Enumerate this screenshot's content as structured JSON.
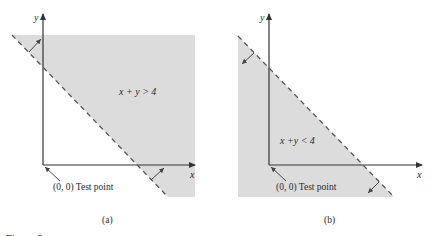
{
  "figure": {
    "caption_partial": "Figure 3.",
    "panels": [
      {
        "id": "a",
        "caption": "(a)",
        "inequality": "x + y > 4",
        "boundary": "x + y = 4",
        "boundary_style": "dashed",
        "shaded_side": "above",
        "axis_x_label": "x",
        "axis_y_label": "y",
        "test_point_label": "(0, 0) Test point"
      },
      {
        "id": "b",
        "caption": "(b)",
        "inequality": "x +y < 4",
        "boundary": "x + y = 4",
        "boundary_style": "dashed",
        "shaded_side": "below",
        "axis_x_label": "x",
        "axis_y_label": "y",
        "test_point_label": "(0, 0) Test point"
      }
    ],
    "colors": {
      "shade": "#dcdcdc",
      "axis": "#333333",
      "dash": "#555555",
      "text": "#2a2a2a"
    }
  }
}
